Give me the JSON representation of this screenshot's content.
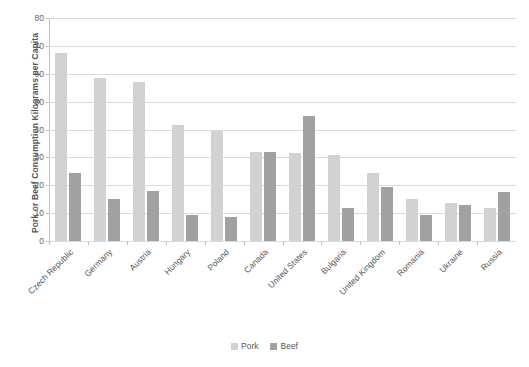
{
  "chart_data": {
    "type": "bar",
    "title": "",
    "xlabel": "",
    "ylabel": "Pork or Beef Consumption Kilograms per Capita",
    "ylim": [
      0,
      80
    ],
    "yticks": [
      0,
      10,
      20,
      30,
      40,
      50,
      60,
      70,
      80
    ],
    "grid": true,
    "legend_position": "bottom",
    "categories": [
      "Czech Republic",
      "Germany",
      "Austria",
      "Hungary",
      "Poland",
      "Canada",
      "United States",
      "Bulgaria",
      "United Kingdom",
      "Romania",
      "Ukraine",
      "Russia"
    ],
    "series": [
      {
        "name": "Pork",
        "color": "#cfcfcf",
        "values": [
          67.5,
          58.5,
          57,
          41.5,
          39.5,
          32,
          31.5,
          31,
          24.5,
          15,
          13.5,
          12
        ]
      },
      {
        "name": "Beef",
        "color": "#9a9a9a",
        "values": [
          24.5,
          15,
          18,
          9.5,
          8.5,
          32,
          45,
          12,
          19.5,
          9.5,
          13,
          17.5
        ]
      }
    ]
  },
  "legend": {
    "items": [
      {
        "label": "Pork"
      },
      {
        "label": "Beef"
      }
    ]
  }
}
